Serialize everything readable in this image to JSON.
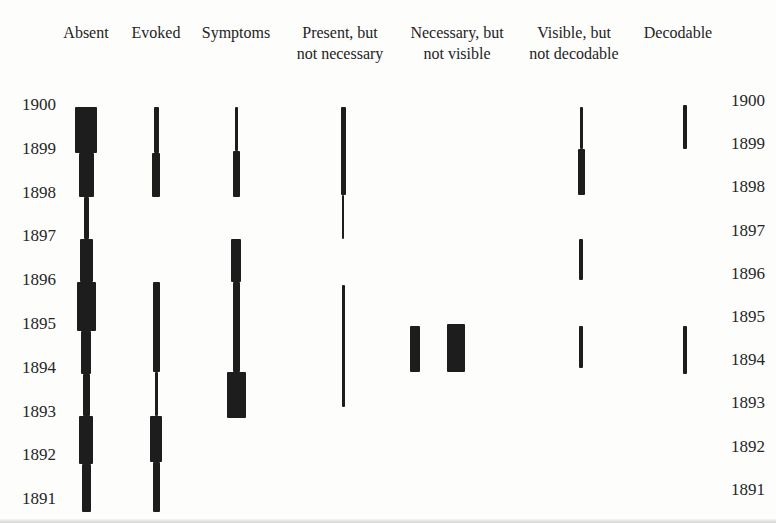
{
  "figure": {
    "background_color": "#fdfdfc",
    "text_color": "#232323",
    "bar_color": "#1d1d1d"
  },
  "chart_data": {
    "type": "timeline",
    "title": "",
    "xlabel": "",
    "ylabel": "year",
    "y_axis": {
      "ticks": [
        1900,
        1899,
        1898,
        1897,
        1896,
        1895,
        1894,
        1893,
        1892,
        1891
      ],
      "top_year": 1900,
      "bottom_year": 1891,
      "shown_on": "both-sides"
    },
    "layout": {
      "left_axis_y_1900": 105,
      "left_axis_px_per_year": 43.8,
      "right_axis_y_1900": 101,
      "right_axis_px_per_year": 43.2,
      "grid": "off",
      "legend": "none"
    },
    "columns": [
      {
        "label": "Absent",
        "label_lines": [
          "Absent"
        ],
        "x_center": 86,
        "strips": [
          {
            "from_year": 1899.95,
            "to_year": 1898.9,
            "weight": 22
          },
          {
            "from_year": 1898.9,
            "to_year": 1897.9,
            "weight": 15
          },
          {
            "from_year": 1897.9,
            "to_year": 1896.95,
            "weight": 5
          },
          {
            "from_year": 1896.95,
            "to_year": 1895.95,
            "weight": 13
          },
          {
            "from_year": 1895.95,
            "to_year": 1894.85,
            "weight": 19
          },
          {
            "from_year": 1894.85,
            "to_year": 1893.85,
            "weight": 10
          },
          {
            "from_year": 1893.85,
            "to_year": 1892.9,
            "weight": 7
          },
          {
            "from_year": 1892.9,
            "to_year": 1891.8,
            "weight": 14
          },
          {
            "from_year": 1891.8,
            "to_year": 1890.7,
            "weight": 9
          }
        ]
      },
      {
        "label": "Evoked",
        "label_lines": [
          "Evoked"
        ],
        "x_center": 156,
        "strips": [
          {
            "from_year": 1899.95,
            "to_year": 1898.9,
            "weight": 5
          },
          {
            "from_year": 1898.9,
            "to_year": 1897.9,
            "weight": 8
          },
          {
            "from_year": 1895.95,
            "to_year": 1893.9,
            "weight": 7
          },
          {
            "from_year": 1893.9,
            "to_year": 1892.9,
            "weight": 3
          },
          {
            "from_year": 1892.9,
            "to_year": 1891.85,
            "weight": 12
          },
          {
            "from_year": 1891.85,
            "to_year": 1890.7,
            "weight": 7
          }
        ]
      },
      {
        "label": "Symptoms",
        "label_lines": [
          "Symptoms"
        ],
        "x_center": 236,
        "strips": [
          {
            "from_year": 1899.95,
            "to_year": 1898.95,
            "weight": 3
          },
          {
            "from_year": 1898.95,
            "to_year": 1897.9,
            "weight": 7
          },
          {
            "from_year": 1896.95,
            "to_year": 1895.95,
            "weight": 10
          },
          {
            "from_year": 1895.95,
            "to_year": 1893.9,
            "weight": 7
          },
          {
            "from_year": 1893.9,
            "to_year": 1892.85,
            "weight": 19
          }
        ]
      },
      {
        "label": "Present, but not necessary",
        "label_lines": [
          "Present, but",
          "not necessary"
        ],
        "x_center": 340,
        "strips": [
          {
            "from_year": 1899.95,
            "to_year": 1897.95,
            "weight": 5,
            "x_center": 343
          },
          {
            "from_year": 1897.95,
            "to_year": 1896.95,
            "weight": 2,
            "x_center": 343
          },
          {
            "from_year": 1895.9,
            "to_year": 1893.1,
            "weight": 3,
            "x_center": 343
          }
        ]
      },
      {
        "label": "Necessary, but not visible",
        "label_lines": [
          "Necessary, but",
          "not visible"
        ],
        "x_center": 457,
        "strips": [
          {
            "from_year": 1894.95,
            "to_year": 1893.9,
            "weight": 10,
            "x_center": 415
          },
          {
            "from_year": 1895.0,
            "to_year": 1893.9,
            "weight": 18,
            "x_center": 456
          }
        ]
      },
      {
        "label": "Visible, but not decodable",
        "label_lines": [
          "Visible, but",
          "not decodable"
        ],
        "x_center": 574,
        "strips": [
          {
            "from_year": 1899.95,
            "to_year": 1899.0,
            "weight": 3,
            "x_center": 581
          },
          {
            "from_year": 1899.0,
            "to_year": 1897.95,
            "weight": 7,
            "x_center": 581
          },
          {
            "from_year": 1896.95,
            "to_year": 1896.0,
            "weight": 4,
            "x_center": 581
          },
          {
            "from_year": 1894.95,
            "to_year": 1894.0,
            "weight": 4,
            "x_center": 581
          }
        ]
      },
      {
        "label": "Decodable",
        "label_lines": [
          "Decodable"
        ],
        "x_center": 678,
        "strips": [
          {
            "from_year": 1900.0,
            "to_year": 1899.0,
            "weight": 4,
            "x_center": 685
          },
          {
            "from_year": 1894.95,
            "to_year": 1893.85,
            "weight": 4,
            "x_center": 685
          }
        ]
      }
    ]
  }
}
